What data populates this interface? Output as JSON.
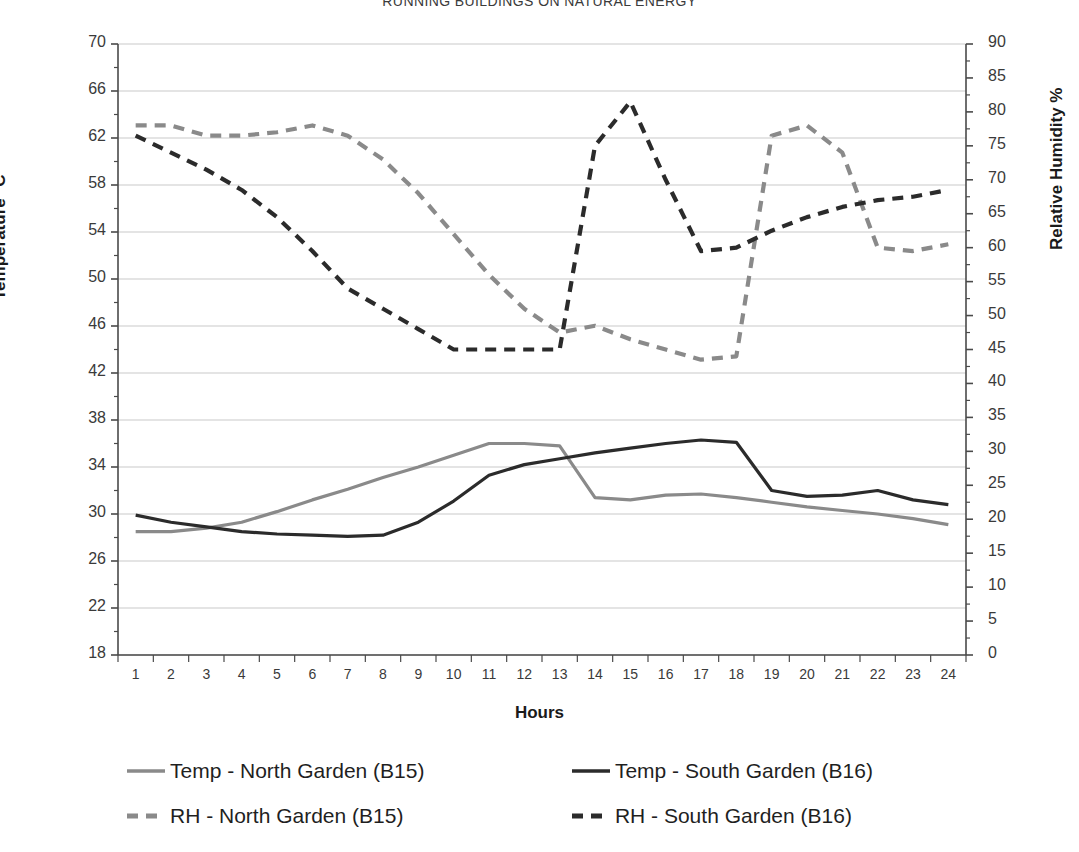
{
  "title": "RUNNING BUILDINGS ON NATURAL ENERGY",
  "axes": {
    "y_left_title": "Temperature °C",
    "y_right_title": "Relative Humidity %",
    "x_title": "Hours"
  },
  "colors": {
    "temp_north": "#8a8a8a",
    "temp_south": "#2b2b2b",
    "rh_north": "#8a8a8a",
    "rh_south": "#2b2b2b",
    "grid": "#c9c9c9",
    "axis": "#4a4a4a",
    "text": "#3a3a3a"
  },
  "legend": {
    "items": [
      {
        "label": "Temp - North Garden (B15)",
        "color": "#8a8a8a",
        "style": "solid"
      },
      {
        "label": "Temp - South Garden (B16)",
        "color": "#2b2b2b",
        "style": "solid"
      },
      {
        "label": "RH - North Garden (B15)",
        "color": "#8a8a8a",
        "style": "dashed"
      },
      {
        "label": "RH - South Garden (B16)",
        "color": "#2b2b2b",
        "style": "dashed"
      }
    ]
  },
  "chart_data": {
    "type": "line",
    "title": "RUNNING BUILDINGS ON NATURAL ENERGY",
    "xlabel": "Hours",
    "ylabel": "Temperature °C",
    "y2label": "Relative Humidity %",
    "grid": true,
    "legend_position": "bottom",
    "x": [
      1,
      2,
      3,
      4,
      5,
      6,
      7,
      8,
      9,
      10,
      11,
      12,
      13,
      14,
      15,
      16,
      17,
      18,
      19,
      20,
      21,
      22,
      23,
      24
    ],
    "xticklabels": [
      "1",
      "2",
      "3",
      "4",
      "5",
      "6",
      "7",
      "8",
      "9",
      "10",
      "11",
      "12",
      "13",
      "14",
      "15",
      "16",
      "17",
      "18",
      "19",
      "20",
      "21",
      "22",
      "23",
      "24"
    ],
    "ylim": [
      18,
      70
    ],
    "yticks": [
      18,
      22,
      26,
      30,
      34,
      38,
      42,
      46,
      50,
      54,
      58,
      62,
      66,
      70
    ],
    "y2lim": [
      0,
      90
    ],
    "y2ticks": [
      0,
      5,
      10,
      15,
      20,
      25,
      30,
      35,
      40,
      45,
      50,
      55,
      60,
      65,
      70,
      75,
      80,
      85,
      90
    ],
    "series": [
      {
        "name": "Temp - North Garden (B15)",
        "axis": "left",
        "color": "#8a8a8a",
        "style": "solid",
        "values": [
          28.5,
          28.5,
          28.8,
          29.3,
          30.2,
          31.2,
          32.1,
          33.1,
          34.0,
          35.0,
          36.0,
          36.0,
          35.8,
          31.4,
          31.2,
          31.6,
          31.7,
          31.4,
          31.0,
          30.6,
          30.3,
          30.0,
          29.6,
          29.1
        ]
      },
      {
        "name": "Temp - South Garden (B16)",
        "axis": "left",
        "color": "#2b2b2b",
        "style": "solid",
        "values": [
          29.9,
          29.3,
          28.9,
          28.5,
          28.3,
          28.2,
          28.1,
          28.2,
          29.3,
          31.1,
          33.3,
          34.2,
          34.7,
          35.2,
          35.6,
          36.0,
          36.3,
          36.1,
          32.0,
          31.5,
          31.6,
          32.0,
          31.2,
          30.8
        ]
      },
      {
        "name": "RH - North Garden (B15)",
        "axis": "right",
        "color": "#8a8a8a",
        "style": "dashed",
        "values": [
          78.0,
          78.0,
          76.5,
          76.5,
          77.0,
          78.0,
          76.5,
          73.0,
          68.0,
          62.0,
          56.0,
          51.0,
          47.5,
          48.5,
          46.5,
          45.0,
          43.5,
          44.0,
          76.5,
          78.0,
          74.0,
          60.0,
          59.5,
          60.5
        ]
      },
      {
        "name": "RH - South Garden (B16)",
        "axis": "right",
        "color": "#2b2b2b",
        "style": "dashed",
        "values": [
          76.5,
          74.0,
          71.5,
          68.5,
          64.5,
          59.5,
          54.0,
          51.0,
          48.0,
          45.0,
          45.0,
          45.0,
          45.0,
          75.0,
          81.5,
          70.0,
          59.5,
          60.0,
          62.5,
          64.5,
          66.0,
          67.0,
          67.5,
          68.5
        ]
      }
    ]
  }
}
